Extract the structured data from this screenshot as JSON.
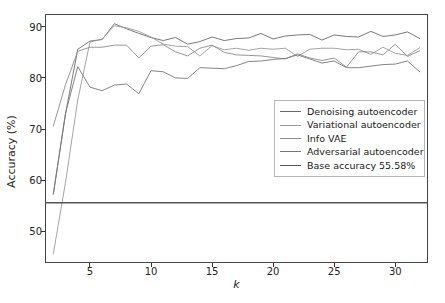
{
  "chart_data": {
    "type": "line",
    "title": "",
    "xlabel": "k",
    "ylabel": "Accuracy (%)",
    "xlim": [
      1.4,
      32.6
    ],
    "ylim": [
      44.0,
      92.3
    ],
    "xticks": [
      5,
      10,
      15,
      20,
      25,
      30
    ],
    "yticks": [
      50,
      60,
      70,
      80,
      90
    ],
    "grid": false,
    "legend_position": "center right",
    "x": [
      2,
      3,
      4,
      5,
      6,
      7,
      8,
      9,
      10,
      11,
      12,
      13,
      14,
      15,
      16,
      17,
      18,
      19,
      20,
      21,
      22,
      23,
      24,
      25,
      26,
      27,
      28,
      29,
      30,
      31,
      32
    ],
    "series": [
      {
        "name": "Denoising autoencoder",
        "color": "#6a6a6a",
        "values": [
          57.3,
          73.0,
          85.6,
          87.2,
          87.5,
          90.6,
          89.6,
          88.7,
          87.9,
          87.3,
          87.9,
          86.6,
          87.1,
          88.0,
          87.3,
          87.7,
          87.8,
          88.7,
          87.6,
          88.2,
          88.4,
          88.5,
          87.4,
          88.4,
          88.1,
          88.0,
          89.1,
          88.1,
          88.4,
          89.0,
          87.7
        ]
      },
      {
        "name": "Variational autoencoder",
        "color": "#9a9a9a",
        "values": [
          45.6,
          59.6,
          75.7,
          87.0,
          87.6,
          90.2,
          89.8,
          89.1,
          88.0,
          86.6,
          86.2,
          86.1,
          84.3,
          86.3,
          85.5,
          85.8,
          85.4,
          85.8,
          85.6,
          85.8,
          84.2,
          85.6,
          85.8,
          85.8,
          85.5,
          85.6,
          84.6,
          86.0,
          84.8,
          84.4,
          85.9
        ]
      },
      {
        "name": "Info VAE",
        "color": "#8b8b8b",
        "values": [
          70.6,
          78.7,
          85.2,
          86.0,
          86.0,
          86.4,
          86.4,
          83.9,
          86.2,
          86.5,
          85.1,
          84.3,
          85.8,
          86.4,
          85.0,
          84.5,
          84.4,
          84.3,
          84.0,
          83.7,
          84.7,
          83.9,
          83.4,
          83.9,
          82.1,
          85.1,
          85.1,
          84.5,
          86.6,
          84.2,
          85.3
        ]
      },
      {
        "name": "Adversarial autoencoder",
        "color": "#777777",
        "values": [
          57.3,
          73.1,
          82.2,
          78.2,
          77.5,
          78.6,
          78.8,
          76.9,
          81.4,
          81.2,
          80.0,
          79.9,
          82.0,
          81.9,
          81.8,
          82.4,
          83.2,
          83.3,
          83.6,
          83.8,
          84.5,
          83.7,
          82.9,
          83.3,
          82.0,
          82.0,
          82.3,
          82.6,
          82.7,
          83.3,
          81.2
        ]
      },
      {
        "name": "Base accuracy 55.58%",
        "color": "#555555",
        "constant": 55.58
      }
    ],
    "legend_entries": [
      "Denoising autoencoder",
      "Variational autoencoder",
      "Info VAE",
      "Adversarial autoencoder",
      "Base accuracy 55.58%"
    ],
    "xtick_labels": [
      "5",
      "10",
      "15",
      "20",
      "25",
      "30"
    ],
    "ytick_labels": [
      "50",
      "60",
      "70",
      "80",
      "90"
    ]
  }
}
